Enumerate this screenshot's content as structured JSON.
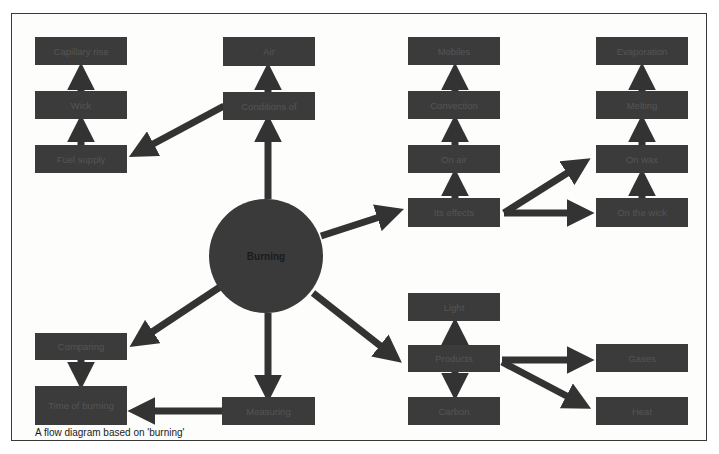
{
  "diagram": {
    "hub": {
      "label": "Burning"
    },
    "nodes": {
      "capillary": {
        "label": "Capillary rise"
      },
      "wick": {
        "label": "Wick"
      },
      "fuel_supply": {
        "label": "Fuel supply"
      },
      "air": {
        "label": "Air"
      },
      "conditions": {
        "label": "Conditions of"
      },
      "mobiles": {
        "label": "Mobiles"
      },
      "convection": {
        "label": "Convection"
      },
      "on_air": {
        "label": "On air"
      },
      "its_effects": {
        "label": "Its effects"
      },
      "evaporation": {
        "label": "Evaporation"
      },
      "melting": {
        "label": "Melting"
      },
      "on_wax": {
        "label": "On wax"
      },
      "on_wick": {
        "label": "On the wick"
      },
      "light": {
        "label": "Light"
      },
      "products": {
        "label": "Products"
      },
      "carbon": {
        "label": "Carbon"
      },
      "gases": {
        "label": "Gases"
      },
      "heat": {
        "label": "Heat"
      },
      "comparing": {
        "label": "Comparing"
      },
      "time_of_burning": {
        "label": "Time of burning"
      },
      "measuring": {
        "label": "Measuring"
      }
    },
    "colors": {
      "node_fill": "#3b3b3b",
      "arrow": "#333333",
      "background": "#fdfdfb"
    }
  },
  "caption": "A flow diagram based on 'burning'"
}
